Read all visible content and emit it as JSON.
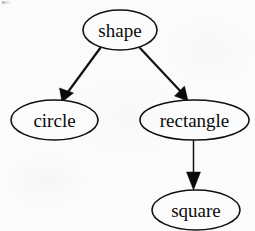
{
  "diagram": {
    "kind": "directed-graph",
    "background_color": "#fbfbfb",
    "ink_color": "#0b0b0b",
    "nodes": [
      {
        "id": "shape",
        "label": "shape",
        "shape": "ellipse",
        "cx": 120,
        "cy": 30,
        "rx": 37,
        "ry": 20,
        "font_size": 19
      },
      {
        "id": "circle",
        "label": "circle",
        "shape": "ellipse",
        "cx": 54.5,
        "cy": 120,
        "rx": 43.5,
        "ry": 20,
        "font_size": 19
      },
      {
        "id": "rectangle",
        "label": "rectangle",
        "shape": "ellipse",
        "cx": 194.5,
        "cy": 120,
        "rx": 54.5,
        "ry": 20,
        "font_size": 19
      },
      {
        "id": "square",
        "label": "square",
        "shape": "ellipse",
        "cx": 196,
        "cy": 210,
        "rx": 44,
        "ry": 20,
        "font_size": 19
      }
    ],
    "edges": [
      {
        "id": "shape-to-circle",
        "from": "shape",
        "to": "circle",
        "directed": true,
        "path": "M 101 47 L 65 96",
        "arrow_points": "62,102 59.5,88 73.5,93",
        "stroke_width": 2.2
      },
      {
        "id": "shape-to-rectangle",
        "from": "shape",
        "to": "rectangle",
        "directed": true,
        "path": "M 139 47 L 184 95",
        "arrow_points": "188,101 174.5,96 184.5,86",
        "stroke_width": 2.2
      },
      {
        "id": "rectangle-to-square",
        "from": "rectangle",
        "to": "square",
        "directed": true,
        "path": "M 193.5 140 L 193.5 182",
        "arrow_points": "193.5,190 186.5,172 200.5,172",
        "stroke_width": 1.5
      }
    ]
  }
}
